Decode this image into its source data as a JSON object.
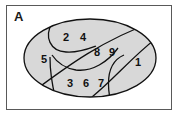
{
  "panel": {
    "label": "A"
  },
  "figure": {
    "shape": "ellipse",
    "fill_color": "#d8d8d8",
    "stroke_color": "#111111",
    "frame_color": "#595959",
    "background_color": "#ffffff"
  },
  "regions": [
    {
      "id": "region-2",
      "label": "2",
      "cx": 60,
      "cy": 33
    },
    {
      "id": "region-4",
      "label": "4",
      "cx": 77,
      "cy": 33
    },
    {
      "id": "region-8",
      "label": "8",
      "cx": 91,
      "cy": 48
    },
    {
      "id": "region-9",
      "label": "9",
      "cx": 106,
      "cy": 48
    },
    {
      "id": "region-5",
      "label": "5",
      "cx": 38,
      "cy": 55
    },
    {
      "id": "region-1",
      "label": "1",
      "cx": 132,
      "cy": 58
    },
    {
      "id": "region-3",
      "label": "3",
      "cx": 64,
      "cy": 79
    },
    {
      "id": "region-6",
      "label": "6",
      "cx": 80,
      "cy": 79
    },
    {
      "id": "region-7",
      "label": "7",
      "cx": 95,
      "cy": 79
    }
  ]
}
